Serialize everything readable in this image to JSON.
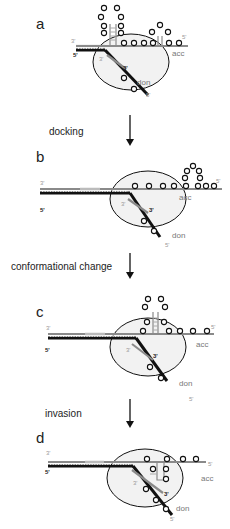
{
  "figure": {
    "panels": [
      {
        "id": "a",
        "label": "a",
        "ends": {
          "top_left": "3'",
          "bottom_left": "5'",
          "acc_5": "5'",
          "don_3_inner": "3'",
          "don_3_outer": "3'",
          "don_5": "5'"
        },
        "strands": {
          "acceptor": "acc",
          "donor": "don"
        }
      },
      {
        "id": "b",
        "label": "b",
        "ends": {
          "top_left": "3'",
          "bottom_left": "5'",
          "acc_5": "5'",
          "don_3_inner": "3'",
          "don_3_outer": "3'",
          "don_5": "5'"
        },
        "strands": {
          "acceptor": "acc",
          "donor": "don"
        }
      },
      {
        "id": "c",
        "label": "c",
        "ends": {
          "top_left": "3'",
          "bottom_left": "5'",
          "acc_5": "5'",
          "don_3_inner": "3'",
          "don_3_outer": "3'",
          "don_5": "5'"
        },
        "strands": {
          "acceptor": "acc",
          "donor": "don"
        }
      },
      {
        "id": "d",
        "label": "d",
        "ends": {
          "top_left": "3'",
          "bottom_left": "5'",
          "acc_5": "5'",
          "don_3_inner": "3'",
          "don_3_outer": "3'",
          "don_5": "5'"
        },
        "strands": {
          "acceptor": "acc",
          "donor": "don"
        }
      }
    ],
    "transitions": [
      {
        "from": "a",
        "to": "b",
        "label": "docking"
      },
      {
        "from": "b",
        "to": "c",
        "label": "conformational change"
      },
      {
        "from": "c",
        "to": "d",
        "label": "invasion"
      }
    ]
  }
}
